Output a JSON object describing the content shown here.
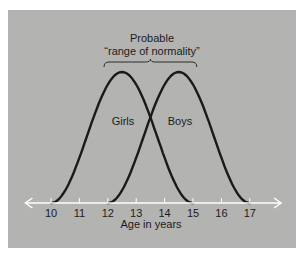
{
  "chart_data": {
    "type": "line",
    "title": "",
    "annotation": {
      "line1": "Probable",
      "line2": "“range of normality”",
      "range": [
        12.5,
        14.5
      ]
    },
    "xlabel": "Age in years",
    "ylabel": "",
    "xlim": [
      9.1,
      18.1
    ],
    "x_ticks": [
      10,
      11,
      12,
      13,
      14,
      15,
      16,
      17
    ],
    "tick_labels": [
      "10",
      "11",
      "12",
      "13",
      "14",
      "15",
      "16",
      "17"
    ],
    "series": [
      {
        "name": "Girls",
        "start": 10,
        "peak": 12.5,
        "end": 15,
        "peak_value": 1.0
      },
      {
        "name": "Boys",
        "start": 12,
        "peak": 14.5,
        "end": 17,
        "peak_value": 1.0
      }
    ],
    "intersection_age": 13.5,
    "grid": false,
    "legend": "inline labels"
  },
  "colors": {
    "background": "#b3b3b1",
    "curve": "#1a1a1a",
    "axis": "#ffffff",
    "text": "#1c1c1c"
  }
}
